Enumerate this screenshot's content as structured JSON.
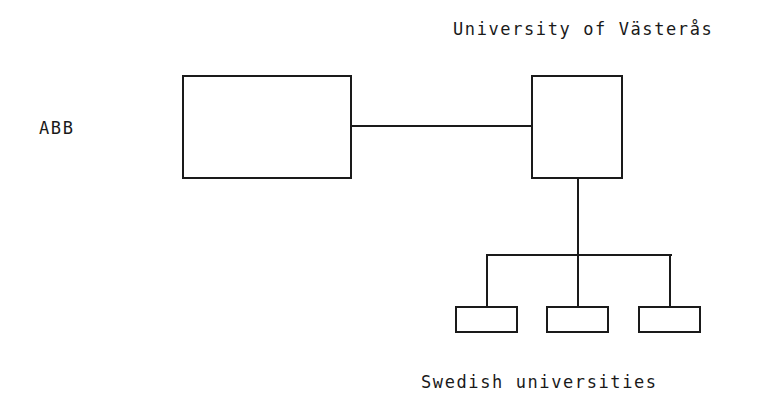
{
  "diagram": {
    "type": "organization-network",
    "nodes": {
      "abb": {
        "label": "ABB"
      },
      "university": {
        "label": "University of Västerås"
      },
      "swedish_universities": {
        "label": "Swedish universities",
        "children_count": 3
      }
    },
    "edges": [
      {
        "from": "abb",
        "to": "university"
      },
      {
        "from": "university",
        "to": "swedish_universities"
      }
    ],
    "colors": {
      "stroke": "#1a1a1a",
      "background": "#ffffff"
    }
  }
}
